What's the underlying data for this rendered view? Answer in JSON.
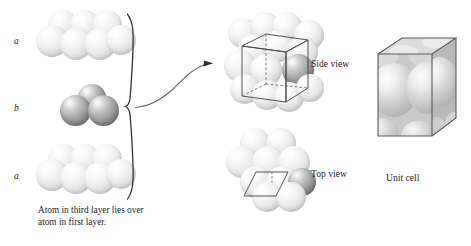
{
  "figure": {
    "background_color": "#ffffff",
    "caption": "Atom in third layer lies over atom in first layer."
  },
  "layer_stack": {
    "labels": [
      {
        "id": "layer-a-top",
        "text": "a",
        "layer": "a",
        "position": "top",
        "sphere_color": "#e6e6e6",
        "sphere_count": 6
      },
      {
        "id": "layer-b-middle",
        "text": "b",
        "layer": "b",
        "position": "middle",
        "sphere_color": "#8d8d8d",
        "sphere_count": 3
      },
      {
        "id": "layer-a-bottom",
        "text": "a",
        "layer": "a",
        "position": "bottom",
        "sphere_color": "#e6e6e6",
        "sphere_count": 6
      }
    ],
    "brace": "}",
    "arrow": "curved-arrow-right"
  },
  "views": [
    {
      "id": "side-view",
      "label": "Side view",
      "overlay": "wireframe-prism",
      "has_dark_atom": true
    },
    {
      "id": "top-view",
      "label": "Top view",
      "overlay": "rhombus-outline",
      "has_dark_atom": true
    }
  ],
  "unit_cell": {
    "label": "Unit cell",
    "shape": "translucent-cube",
    "face_color": "#bdbdbd",
    "edge_color": "#5a5a5a",
    "atom_color": "#d0d0d0"
  },
  "icons": {
    "brace": "curly-brace-icon",
    "arrow": "curved-arrow-icon"
  },
  "colors": {
    "light_sphere": "#e6e6e6",
    "dark_sphere": "#8d8d8d",
    "line": "#3a3a3a",
    "text": "#1d1d1d"
  }
}
